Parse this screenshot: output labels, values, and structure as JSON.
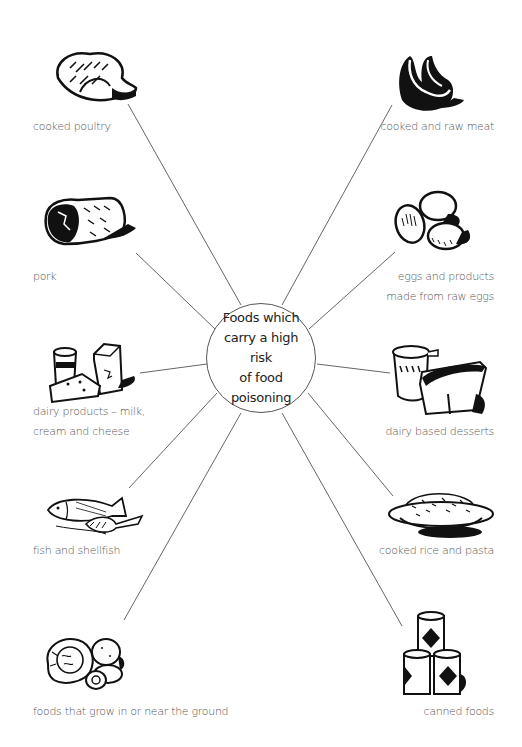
{
  "center": {
    "lines": [
      "Foods which",
      "carry a high risk",
      "of food",
      "poisoning"
    ]
  },
  "items": [
    {
      "id": "poultry",
      "label": [
        "cooked poultry"
      ],
      "icon": "roast-chicken-icon",
      "side": "left"
    },
    {
      "id": "meat",
      "label": [
        "cooked and raw meat"
      ],
      "icon": "raw-meat-icon",
      "side": "right"
    },
    {
      "id": "pork",
      "label": [
        "pork"
      ],
      "icon": "pork-joint-icon",
      "side": "left"
    },
    {
      "id": "eggs",
      "label": [
        "eggs and products",
        "made from raw eggs"
      ],
      "icon": "eggs-icon",
      "side": "right"
    },
    {
      "id": "dairy",
      "label": [
        "dairy products – milk,",
        "cream and cheese"
      ],
      "icon": "dairy-icon",
      "side": "left"
    },
    {
      "id": "desserts",
      "label": [
        "dairy based desserts"
      ],
      "icon": "dessert-pots-icon",
      "side": "right"
    },
    {
      "id": "fish",
      "label": [
        "fish and shellfish"
      ],
      "icon": "fish-icon",
      "side": "left"
    },
    {
      "id": "rice",
      "label": [
        "cooked rice and pasta"
      ],
      "icon": "rice-bowl-icon",
      "side": "right"
    },
    {
      "id": "ground",
      "label": [
        "foods that grow in or near the ground"
      ],
      "icon": "vegetables-icon",
      "side": "left"
    },
    {
      "id": "canned",
      "label": [
        "canned foods"
      ],
      "icon": "cans-icon",
      "side": "right"
    }
  ],
  "colors": {
    "line": "#666666",
    "label": "#555555",
    "ink": "#111111",
    "hub_text": "#222222"
  }
}
